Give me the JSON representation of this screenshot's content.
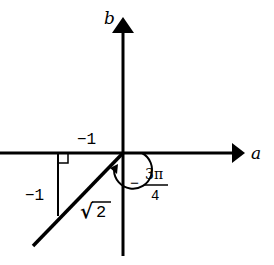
{
  "diagram": {
    "type": "complex-plane-polar-form",
    "axes": {
      "horizontal_label": "a",
      "vertical_label": "b"
    },
    "point": {
      "a": -1,
      "b": -1
    },
    "labels": {
      "horizontal_leg": "−1",
      "vertical_leg": "−1",
      "hypotenuse_radical": "√",
      "hypotenuse_value": "2",
      "angle_sign": "−",
      "angle_numerator": "3π",
      "angle_denominator": "4"
    },
    "colors": {
      "stroke": "#000000",
      "background": "#ffffff"
    }
  }
}
